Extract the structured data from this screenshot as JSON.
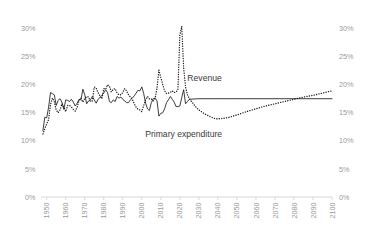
{
  "chart_data": {
    "type": "line",
    "title": "",
    "subtitle": "",
    "xlabel": "",
    "ylabel": "",
    "xlim": [
      1947,
      2100
    ],
    "ylim": [
      0,
      30
    ],
    "grid": false,
    "legend_position": "inline-annotation",
    "y_ticks": [
      "0%",
      "5%",
      "10%",
      "15%",
      "20%",
      "25%",
      "30%"
    ],
    "y_tick_values": [
      0,
      5,
      10,
      15,
      20,
      25,
      30
    ],
    "y_axis_right_ticks": [
      "0%",
      "5%",
      "10%",
      "15%",
      "20%",
      "25%",
      "30%"
    ],
    "x_ticks": [
      "1950",
      "1960",
      "1970",
      "1980",
      "1990",
      "2000",
      "2010",
      "2020",
      "2030",
      "2040",
      "2050",
      "2060",
      "2070",
      "2080",
      "2090",
      "2100"
    ],
    "x_tick_values": [
      1950,
      1960,
      1970,
      1980,
      1990,
      2000,
      2010,
      2020,
      2030,
      2040,
      2050,
      2060,
      2070,
      2080,
      2090,
      2100
    ],
    "annotations": [
      {
        "name": "revenue-label",
        "text": "Revenue",
        "x": 2033,
        "y": 20.6
      },
      {
        "name": "primary-expenditure-label",
        "text": "Primary expenditure",
        "x": 2022,
        "y": 10.6
      }
    ],
    "series": [
      {
        "name": "Revenue",
        "style": "solid",
        "color": "#1a1a1a",
        "x": [
          1948,
          1949,
          1950,
          1951,
          1952,
          1953,
          1954,
          1955,
          1956,
          1957,
          1958,
          1959,
          1960,
          1961,
          1962,
          1963,
          1964,
          1965,
          1966,
          1967,
          1968,
          1969,
          1970,
          1971,
          1972,
          1973,
          1974,
          1975,
          1976,
          1977,
          1978,
          1979,
          1980,
          1981,
          1982,
          1983,
          1984,
          1985,
          1986,
          1987,
          1988,
          1989,
          1990,
          1991,
          1992,
          1993,
          1994,
          1995,
          1996,
          1997,
          1998,
          1999,
          2000,
          2001,
          2002,
          2003,
          2004,
          2005,
          2006,
          2007,
          2008,
          2009,
          2010,
          2011,
          2012,
          2013,
          2014,
          2015,
          2016,
          2017,
          2018,
          2019,
          2020,
          2021,
          2022,
          2023,
          2024,
          2025,
          2030,
          2040,
          2050,
          2060,
          2070,
          2080,
          2090,
          2100
        ],
        "values": [
          11.8,
          14.2,
          14.1,
          16.0,
          18.6,
          18.4,
          18.2,
          16.3,
          17.2,
          17.5,
          16.9,
          15.6,
          17.3,
          17.2,
          17.0,
          17.4,
          16.9,
          16.2,
          16.7,
          17.4,
          17.3,
          19.2,
          18.2,
          16.6,
          17.1,
          17.3,
          17.9,
          17.3,
          16.7,
          17.4,
          17.7,
          18.1,
          18.5,
          19.1,
          18.6,
          17.0,
          16.8,
          17.3,
          17.0,
          17.9,
          17.6,
          17.8,
          17.4,
          17.1,
          16.8,
          16.8,
          17.3,
          17.6,
          18.0,
          18.5,
          19.0,
          18.9,
          19.6,
          18.4,
          16.7,
          15.7,
          15.4,
          16.8,
          17.5,
          17.6,
          17.1,
          14.4,
          14.9,
          15.0,
          15.7,
          16.8,
          17.3,
          17.9,
          17.4,
          16.9,
          16.1,
          16.1,
          16.2,
          17.7,
          19.1,
          16.6,
          17.0,
          17.4,
          17.5,
          17.5,
          17.5,
          17.5,
          17.5,
          17.5,
          17.5,
          17.5
        ]
      },
      {
        "name": "Primary expenditure",
        "style": "dotted",
        "color": "#1a1a1a",
        "x": [
          1948,
          1949,
          1950,
          1951,
          1952,
          1953,
          1954,
          1955,
          1956,
          1957,
          1958,
          1959,
          1960,
          1961,
          1962,
          1963,
          1964,
          1965,
          1966,
          1967,
          1968,
          1969,
          1970,
          1971,
          1972,
          1973,
          1974,
          1975,
          1976,
          1977,
          1978,
          1979,
          1980,
          1981,
          1982,
          1983,
          1984,
          1985,
          1986,
          1987,
          1988,
          1989,
          1990,
          1991,
          1992,
          1993,
          1994,
          1995,
          1996,
          1997,
          1998,
          1999,
          2000,
          2001,
          2002,
          2003,
          2004,
          2005,
          2006,
          2007,
          2008,
          2009,
          2010,
          2011,
          2012,
          2013,
          2014,
          2015,
          2016,
          2017,
          2018,
          2019,
          2020,
          2021,
          2022,
          2023,
          2024,
          2025,
          2028,
          2030,
          2033,
          2036,
          2038,
          2040,
          2043,
          2046,
          2050,
          2055,
          2060,
          2065,
          2070,
          2075,
          2080,
          2085,
          2090,
          2095,
          2100
        ],
        "values": [
          11.2,
          12.2,
          13.0,
          13.8,
          16.5,
          17.6,
          17.0,
          15.5,
          15.0,
          15.5,
          16.6,
          16.0,
          15.2,
          16.3,
          16.3,
          16.0,
          15.6,
          15.3,
          16.0,
          17.2,
          17.6,
          16.9,
          17.5,
          17.9,
          17.8,
          17.0,
          17.1,
          19.6,
          19.4,
          18.6,
          18.0,
          17.5,
          19.3,
          19.2,
          20.0,
          19.7,
          18.7,
          19.2,
          19.3,
          18.5,
          18.2,
          18.2,
          18.6,
          19.3,
          18.9,
          18.2,
          17.8,
          17.4,
          16.6,
          16.0,
          15.6,
          15.5,
          15.2,
          16.3,
          17.3,
          17.9,
          17.5,
          17.5,
          17.1,
          17.6,
          19.4,
          22.6,
          21.3,
          20.0,
          18.9,
          18.4,
          18.5,
          18.6,
          18.9,
          18.6,
          18.7,
          19.1,
          28.9,
          30.4,
          23.0,
          19.6,
          18.2,
          17.5,
          16.2,
          15.5,
          14.8,
          14.3,
          14.0,
          13.9,
          14.0,
          14.2,
          14.6,
          15.2,
          15.7,
          16.2,
          16.6,
          17.0,
          17.4,
          17.8,
          18.1,
          18.5,
          18.9
        ]
      }
    ]
  }
}
